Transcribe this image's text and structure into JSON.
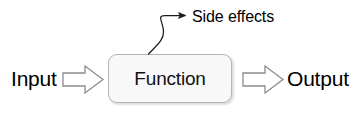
{
  "diagram": {
    "title_text_nodes": {
      "input": "Input",
      "function": "Function",
      "output": "Output",
      "side_effects": "Side effects"
    },
    "colors": {
      "background": "#ffffff",
      "text": "#000000",
      "box_fill": "#f8f8f8",
      "box_border": "#b4b4b4",
      "arrow_fill": "#ffffff",
      "arrow_stroke": "#8c8c8c",
      "curve_stroke": "#1a1a1a"
    },
    "nodes": [
      {
        "id": "input",
        "label": "Input",
        "kind": "text-label"
      },
      {
        "id": "function",
        "label": "Function",
        "kind": "rounded-box"
      },
      {
        "id": "output",
        "label": "Output",
        "kind": "text-label"
      },
      {
        "id": "side_effects",
        "label": "Side effects",
        "kind": "text-label"
      }
    ],
    "edges": [
      {
        "id": "input-to-function",
        "from": "input",
        "to": "function",
        "style": "block-arrow",
        "direction": "right"
      },
      {
        "id": "function-to-output",
        "from": "function",
        "to": "output",
        "style": "block-arrow",
        "direction": "right"
      },
      {
        "id": "function-to-side-effects",
        "from": "function",
        "to": "side_effects",
        "style": "curved-line-arrow",
        "direction": "up-right"
      }
    ]
  }
}
